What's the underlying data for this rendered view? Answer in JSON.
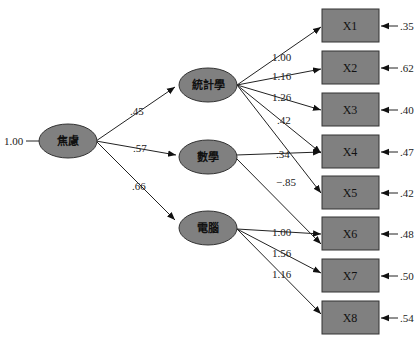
{
  "diagram": {
    "type": "structural-equation-model",
    "colors": {
      "node_fill": "#808080",
      "node_stroke": "#333333",
      "edge": "#222222",
      "background": "#ffffff"
    },
    "second_order_factor": {
      "label": "焦慮",
      "variance": "1.00"
    },
    "first_order_factors": [
      {
        "label": "統計學",
        "loading": ".45"
      },
      {
        "label": "數學",
        "loading": ".57"
      },
      {
        "label": "電腦",
        "loading": ".66"
      }
    ],
    "indicators": [
      {
        "label": "X1",
        "error": ".35"
      },
      {
        "label": "X2",
        "error": ".62"
      },
      {
        "label": "X3",
        "error": ".40"
      },
      {
        "label": "X4",
        "error": ".47"
      },
      {
        "label": "X5",
        "error": ".42"
      },
      {
        "label": "X6",
        "error": ".48"
      },
      {
        "label": "X7",
        "error": ".50"
      },
      {
        "label": "X8",
        "error": ".54"
      }
    ],
    "paths": [
      {
        "from": "統計學",
        "to": "X1",
        "value": "1.00"
      },
      {
        "from": "統計學",
        "to": "X2",
        "value": "1.16"
      },
      {
        "from": "統計學",
        "to": "X3",
        "value": "1.26"
      },
      {
        "from": "統計學",
        "to": "X4",
        "value": ".42"
      },
      {
        "from": "數學",
        "to": "X4",
        "value": ".34"
      },
      {
        "from": "統計學",
        "to": "X5",
        "value": "−.85"
      },
      {
        "from": "電腦",
        "to": "X6",
        "value": "1.00"
      },
      {
        "from": "電腦",
        "to": "X7",
        "value": "1.56"
      },
      {
        "from": "電腦",
        "to": "X8",
        "value": "1.16"
      }
    ]
  }
}
